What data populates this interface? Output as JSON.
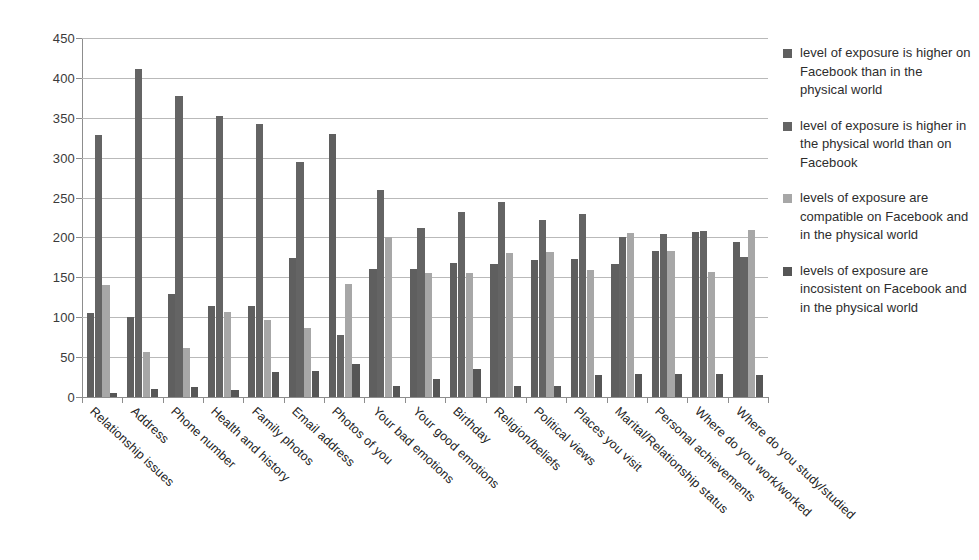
{
  "chart_data": {
    "type": "bar",
    "title": "",
    "xlabel": "",
    "ylabel": "",
    "ylim": [
      0,
      450
    ],
    "ytick_step": 50,
    "yticks": [
      0,
      50,
      100,
      150,
      200,
      250,
      300,
      350,
      400,
      450
    ],
    "grid": true,
    "legend_position": "right",
    "categories": [
      "Relationship issues",
      "Address",
      "Phone number",
      "Health and history",
      "Family photos",
      "Email address",
      "Photos of you",
      "Your bad emotions",
      "Your good emotions",
      "Birthday",
      "Religion/beliefs",
      "Political views",
      "Places you visit",
      "Marital/Relationship status",
      "Personal achievements",
      "Where do you work/worked",
      "Where do you study/studied"
    ],
    "series": [
      {
        "name": "level of exposure is higher on Facebook than in the physical world",
        "color": "#5f5f5f",
        "values": [
          105,
          100,
          129,
          114,
          114,
          174,
          330,
          160,
          160,
          168,
          167,
          172,
          173,
          167,
          183,
          207,
          194
        ]
      },
      {
        "name": "level of exposure is higher in the physical world than on Facebook",
        "color": "#646464",
        "values": [
          328,
          411,
          377,
          352,
          342,
          294,
          78,
          259,
          212,
          232,
          244,
          222,
          229,
          201,
          204,
          208,
          175
        ]
      },
      {
        "name": "levels of exposure are compatible on Facebook and in the physical world",
        "color": "#a7a7a7",
        "values": [
          140,
          56,
          61,
          107,
          97,
          87,
          142,
          201,
          155,
          155,
          181,
          182,
          159,
          206,
          183,
          157,
          209
        ]
      },
      {
        "name": "levels of exposure are incosistent on Facebook and in the physical world",
        "color": "#565656",
        "values": [
          5,
          10,
          13,
          9,
          31,
          32,
          42,
          14,
          22,
          35,
          14,
          14,
          28,
          29,
          29,
          29,
          27
        ]
      }
    ]
  },
  "legend": {
    "items": [
      "level of exposure is higher on Facebook than in the physical world",
      "level of exposure is higher in the physical world than on Facebook",
      "levels of exposure are compatible on Facebook and in the physical world",
      "levels of exposure are incosistent on Facebook and in the physical world"
    ]
  }
}
